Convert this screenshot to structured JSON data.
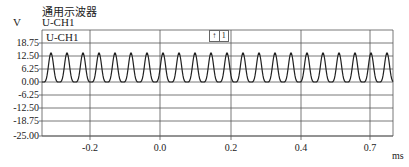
{
  "header": {
    "title": "通用示波器",
    "y_unit": "V",
    "channel_label": "U-CH1"
  },
  "plot": {
    "inner_label": "U-CH1",
    "trigger_icons": [
      "rising-edge",
      "1"
    ],
    "x_unit": "ms"
  },
  "chart_data": {
    "type": "line",
    "title": "通用示波器",
    "xlabel": "ms",
    "ylabel": "V",
    "series": [
      {
        "name": "U-CH1",
        "description": "periodic pulse train (raised sinusoid-like pulses), min 0 V, peak ≈ 14 V, ≈22 cycles across visible window"
      }
    ],
    "y_ticks": [
      "18.75",
      "12.50",
      "6.25",
      "0.00",
      "-6.25",
      "-12.50",
      "-18.75",
      "-25.00"
    ],
    "x_ticks": [
      "-0.2",
      "0.0",
      "0.2",
      "0.4",
      "0.7"
    ],
    "ylim": [
      -25.0,
      25.0
    ],
    "grid": true,
    "waveform": {
      "min": 0.0,
      "peak": 14.0,
      "cycles_visible": 22
    }
  }
}
